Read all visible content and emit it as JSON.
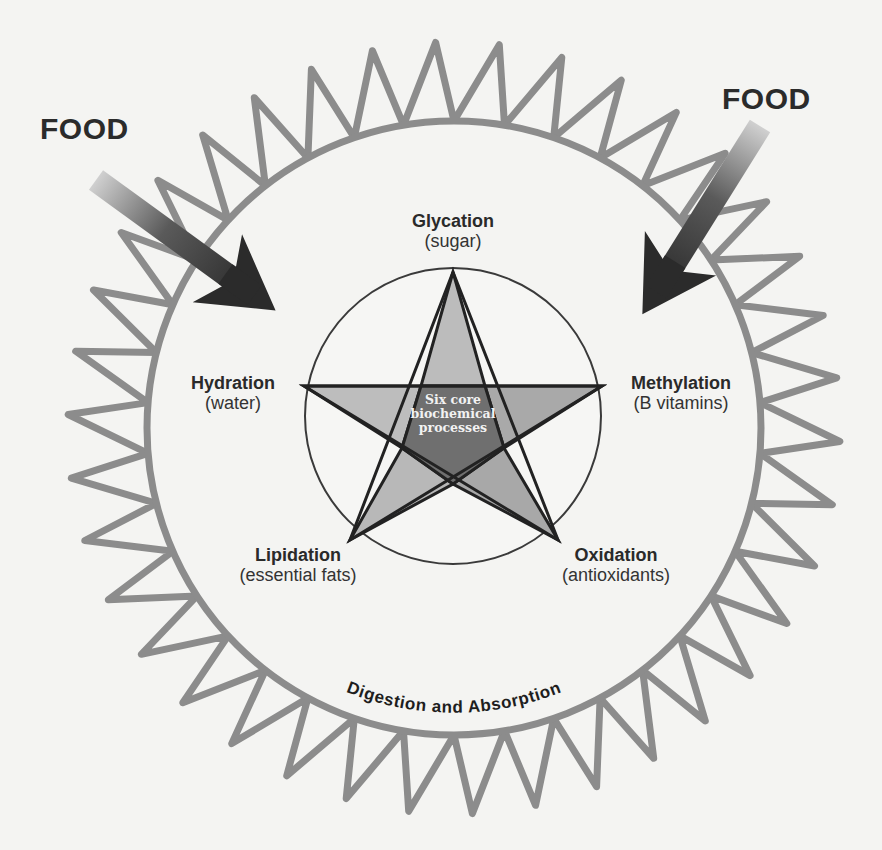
{
  "diagram": {
    "type": "concept-diagram",
    "outer_ring_label": "Digestion and Absorption",
    "center_label": {
      "line1": "Six core",
      "line2": "biochemical",
      "line3": "processes"
    },
    "inputs": [
      {
        "label": "FOOD",
        "position": "top-left"
      },
      {
        "label": "FOOD",
        "position": "top-right"
      }
    ],
    "processes": [
      {
        "name": "Glycation",
        "nutrient": "(sugar)",
        "position": "top"
      },
      {
        "name": "Hydration",
        "nutrient": "(water)",
        "position": "left"
      },
      {
        "name": "Methylation",
        "nutrient": "(B vitamins)",
        "position": "right"
      },
      {
        "name": "Lipidation",
        "nutrient": "(essential fats)",
        "position": "bottom-left"
      },
      {
        "name": "Oxidation",
        "nutrient": "(antioxidants)",
        "position": "bottom-right"
      }
    ],
    "colors": {
      "ring": "#8c8c8c",
      "star_points": "#b9b9b9",
      "star_center": "#6e6e6e",
      "outline": "#2a2a2a",
      "arrow_dark": "#2e2e2e",
      "arrow_light": "#c8c8c8",
      "background": "#f4f4f2"
    }
  }
}
